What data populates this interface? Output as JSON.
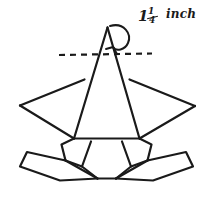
{
  "image": {
    "kind": "hand-drawn-sketch",
    "subject": "witch hat sewing pattern diagram",
    "width": 210,
    "height": 197,
    "background_color": "#ffffff",
    "ink_color": "#1a1a1a"
  },
  "annotation": {
    "whole_number": "1",
    "fraction_numerator": "1",
    "fraction_denominator": "4",
    "unit": "inch",
    "full_text": "1 1/4 inch",
    "pointer": "curved-arrow-to-cone-apex"
  },
  "geometry": {
    "cone": {
      "apex": [
        107,
        27
      ],
      "left_base": [
        74,
        138
      ],
      "right_base": [
        139,
        138
      ],
      "description": "tall narrow triangle forming the hat cone"
    },
    "dashed_line": {
      "y": 54,
      "x_start": 59,
      "x_end": 152,
      "dash_pattern": "6 5",
      "description": "horizontal dashed seam-allowance line across cone"
    },
    "left_wing": {
      "points": [
        [
          84,
          80
        ],
        [
          20,
          105
        ],
        [
          74,
          138
        ]
      ],
      "description": "left brim wing triangle"
    },
    "right_wing": {
      "points": [
        [
          129,
          80
        ],
        [
          195,
          106
        ],
        [
          139,
          138
        ]
      ],
      "description": "right brim wing triangle"
    },
    "brim_top_edge": {
      "from": [
        74,
        138
      ],
      "to": [
        139,
        138
      ]
    },
    "lower_left_panel": {
      "points": [
        [
          74,
          138
        ],
        [
          62,
          144
        ],
        [
          66,
          160
        ],
        [
          80,
          166
        ],
        [
          97,
          178
        ]
      ],
      "description": "left lower brim fold panel"
    },
    "lower_right_panel": {
      "points": [
        [
          139,
          138
        ],
        [
          151,
          144
        ],
        [
          147,
          160
        ],
        [
          133,
          166
        ],
        [
          116,
          178
        ]
      ],
      "description": "right lower brim fold panel"
    },
    "outer_left_flap": {
      "points": [
        [
          66,
          160
        ],
        [
          27,
          152
        ],
        [
          20,
          166
        ],
        [
          60,
          180
        ],
        [
          97,
          178
        ]
      ],
      "description": "outer left brim flap"
    },
    "outer_right_flap": {
      "points": [
        [
          147,
          160
        ],
        [
          186,
          152
        ],
        [
          193,
          166
        ],
        [
          153,
          180
        ],
        [
          116,
          178
        ]
      ],
      "description": "outer right brim flap"
    },
    "bottom_edge": {
      "from": [
        97,
        178
      ],
      "to": [
        116,
        178
      ]
    }
  },
  "strokes": {
    "main_width": 2.2,
    "thin_width": 1.7,
    "dash_width": 2.2,
    "linecap": "round",
    "linejoin": "round"
  }
}
